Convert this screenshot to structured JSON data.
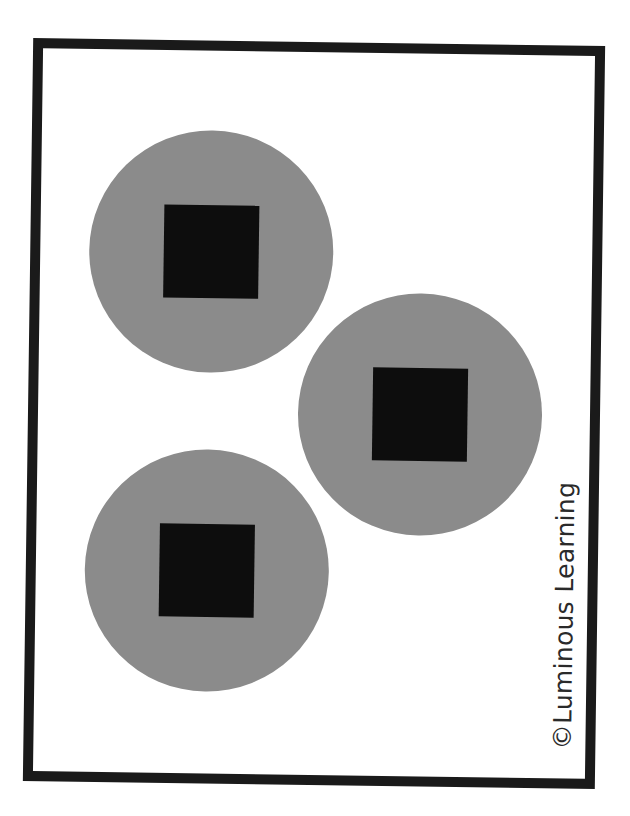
{
  "card": {
    "border_color": "#1a1a1a",
    "circle_color": "#8b8b8b",
    "square_color": "#0d0d0d",
    "circles": [
      {
        "id": 1,
        "cx": 171,
        "cy": 201
      },
      {
        "id": 2,
        "cx": 382,
        "cy": 361
      },
      {
        "id": 3,
        "cx": 171,
        "cy": 520
      }
    ],
    "credit": "©Luminous Learning"
  }
}
